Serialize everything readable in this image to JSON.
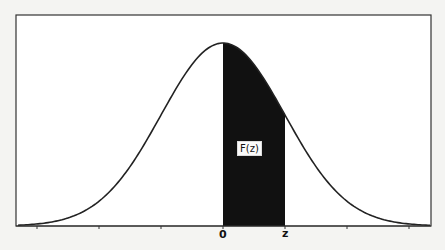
{
  "diagram": {
    "type": "normal-curve",
    "shaded_region": {
      "from": "0",
      "to": "z",
      "label": "F(z)",
      "fill": "#111111"
    },
    "axis_labels": {
      "origin": "0",
      "z": "z"
    },
    "ticks_sd": [
      -3,
      -2,
      -1,
      0,
      1,
      2,
      3
    ],
    "z_value_sd": 1.0,
    "colors": {
      "background": "#f4f4f2",
      "curve": "#222222",
      "frame": "#333333",
      "shade": "#111111"
    }
  }
}
